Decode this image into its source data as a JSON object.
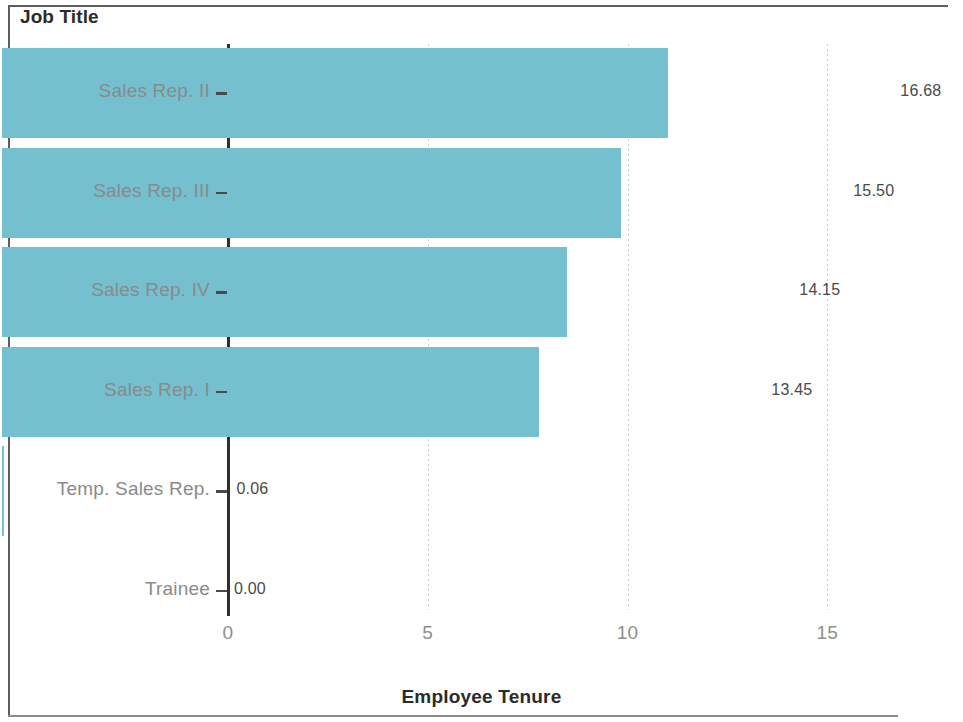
{
  "figure": {
    "title": "Job Title",
    "x_axis_title": "Employee Tenure",
    "bar_color": "#74c0cf",
    "grid_color": "#c9c9c9",
    "axis_color": "#2f2f2f",
    "label_color": "#8a8a8a"
  },
  "chart_data": {
    "type": "bar",
    "orientation": "horizontal",
    "title": "Job Title",
    "xlabel": "Employee Tenure",
    "ylabel": "Job Title",
    "categories": [
      "Sales Rep. II",
      "Sales Rep. III",
      "Sales Rep. IV",
      "Sales Rep. I",
      "Temp. Sales Rep.",
      "Trainee"
    ],
    "values": [
      16.68,
      15.5,
      14.15,
      13.45,
      0.06,
      0.0
    ],
    "value_labels": [
      "16.68",
      "15.50",
      "14.15",
      "13.45",
      "0.06",
      "0.00"
    ],
    "xlim": [
      0,
      17.5
    ],
    "xticks": [
      0,
      5,
      10,
      15
    ],
    "xtick_labels": [
      "0",
      "5",
      "10",
      "15"
    ],
    "grid": "vertical-dotted",
    "legend": null,
    "series": [
      {
        "name": "Employee Tenure",
        "values": [
          16.68,
          15.5,
          14.15,
          13.45,
          0.06,
          0.0
        ]
      }
    ]
  }
}
